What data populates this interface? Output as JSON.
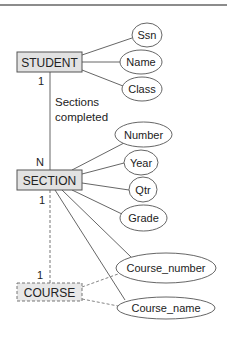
{
  "diagram": {
    "type": "er-diagram",
    "colors": {
      "entity_fill": "#e2e2e2",
      "stroke": "#555555",
      "text": "#222222",
      "top_rule": "#8c8c8c"
    },
    "entities": {
      "student": {
        "label": "STUDENT",
        "style": "solid"
      },
      "section": {
        "label": "SECTION",
        "style": "solid"
      },
      "course": {
        "label": "COURSE",
        "style": "dashed"
      }
    },
    "attributes": {
      "ssn": "Ssn",
      "name": "Name",
      "class": "Class",
      "number": "Number",
      "year": "Year",
      "qtr": "Qtr",
      "grade": "Grade",
      "course_number": "Course_number",
      "course_name": "Course_name"
    },
    "relationships": {
      "sections_completed": {
        "label_line1": "Sections",
        "label_line2": "completed",
        "card_student": "1",
        "card_section": "N"
      },
      "section_course": {
        "card_section": "1",
        "card_course": "1",
        "style": "dashed"
      }
    }
  }
}
